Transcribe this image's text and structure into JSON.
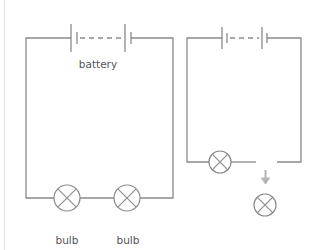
{
  "diagram": {
    "left_circuit": {
      "battery_label": "battery",
      "bulb_labels": [
        "bulb",
        "bulb"
      ]
    },
    "right_circuit": {
      "bulbs_in_circuit": 1,
      "bulb_removed": true
    },
    "colors": {
      "wire": "#8a8a8a",
      "arrow": "#b5b5b5",
      "label": "#555555"
    }
  }
}
